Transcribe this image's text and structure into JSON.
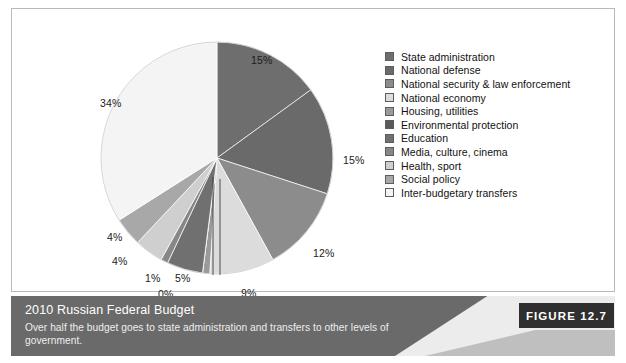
{
  "figure": {
    "badge_label": "FIGURE 12.7",
    "caption_title": "2010 Russian Federal Budget",
    "caption_subtitle": "Over half the budget goes to state administration and transfers to other levels of government."
  },
  "legend": {
    "items": [
      {
        "label": "State administration",
        "color": "#6e6e6e"
      },
      {
        "label": "National defense",
        "color": "#6a6a6a"
      },
      {
        "label": "National security & law enforcement",
        "color": "#8c8c8c"
      },
      {
        "label": "National economy",
        "color": "#dcdcdc"
      },
      {
        "label": "Housing, utilities",
        "color": "#9a9a9a"
      },
      {
        "label": "Environmental protection",
        "color": "#5a5a5a"
      },
      {
        "label": "Education",
        "color": "#707070"
      },
      {
        "label": "Media, culture, cinema",
        "color": "#878787"
      },
      {
        "label": "Health, sport",
        "color": "#cfcfcf"
      },
      {
        "label": "Social policy",
        "color": "#a8a8a8"
      },
      {
        "label": "Inter-budgetary transfers",
        "color": "#f4f4f4"
      }
    ]
  },
  "chart_data": {
    "type": "pie",
    "title": "2010 Russian Federal Budget",
    "subtitle": "Over half the budget goes to state administration and transfers to other levels of government.",
    "unit": "percent",
    "start_angle_deg": 0,
    "direction": "clockwise",
    "legend_position": "right",
    "categories": [
      "State administration",
      "National defense",
      "National security & law enforcement",
      "National economy",
      "Housing, utilities",
      "Environmental protection",
      "Education",
      "Media, culture, cinema",
      "Health, sport",
      "Social policy",
      "Inter-budgetary transfers"
    ],
    "values": [
      15,
      15,
      12,
      9,
      1,
      0,
      5,
      1,
      4,
      4,
      34
    ],
    "labels": [
      "15%",
      "15%",
      "12%",
      "9%",
      "1%",
      "0%",
      "5%",
      "1%",
      "4%",
      "4%",
      "34%"
    ],
    "colors": [
      "#6e6e6e",
      "#6a6a6a",
      "#8c8c8c",
      "#dcdcdc",
      "#9a9a9a",
      "#5a5a5a",
      "#707070",
      "#878787",
      "#cfcfcf",
      "#a8a8a8",
      "#f4f4f4"
    ],
    "slice_label_positions": [
      {
        "text": "15%",
        "x": 151,
        "y": 13,
        "leader": false
      },
      {
        "text": "15%",
        "x": 243,
        "y": 113,
        "leader": false
      },
      {
        "text": "12%",
        "x": 213,
        "y": 206,
        "leader": false
      },
      {
        "text": "9%",
        "x": 141,
        "y": 246,
        "leader": false
      },
      {
        "text": "1%",
        "x": 47,
        "y": 261,
        "leader": true
      },
      {
        "text": "0%",
        "x": 58,
        "y": 247,
        "leader": true
      },
      {
        "text": "5%",
        "x": 75,
        "y": 231,
        "leader": false
      },
      {
        "text": "1%",
        "x": 45,
        "y": 231,
        "leader": false
      },
      {
        "text": "4%",
        "x": 12,
        "y": 214,
        "leader": false
      },
      {
        "text": "4%",
        "x": 7,
        "y": 190,
        "leader": false
      },
      {
        "text": "34%",
        "x": 0,
        "y": 56,
        "leader": false
      }
    ]
  }
}
